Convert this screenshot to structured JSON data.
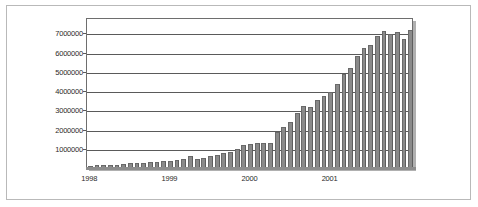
{
  "chart_data": {
    "type": "bar",
    "title": "",
    "subtitle": "",
    "xlabel": "",
    "ylabel": "",
    "legend": [],
    "grid": true,
    "ylim": [
      0,
      7800000
    ],
    "ytick_labels": [
      "1000000",
      "2000000",
      "3000000",
      "4000000",
      "5000000",
      "6000000",
      "7000000"
    ],
    "ytick_values": [
      1000000,
      2000000,
      3000000,
      4000000,
      5000000,
      6000000,
      7000000
    ],
    "xtick_labels": [
      "1998",
      "1999",
      "2000",
      "2001"
    ],
    "xtick_positions": [
      0,
      12,
      24,
      36
    ],
    "bar_color": "#8a8a8a",
    "categories": [
      "1998-01",
      "1998-02",
      "1998-03",
      "1998-04",
      "1998-05",
      "1998-06",
      "1998-07",
      "1998-08",
      "1998-09",
      "1998-10",
      "1998-11",
      "1998-12",
      "1999-01",
      "1999-02",
      "1999-03",
      "1999-04",
      "1999-05",
      "1999-06",
      "1999-07",
      "1999-08",
      "1999-09",
      "1999-10",
      "1999-11",
      "1999-12",
      "2000-01",
      "2000-02",
      "2000-03",
      "2000-04",
      "2000-05",
      "2000-06",
      "2000-07",
      "2000-08",
      "2000-09",
      "2000-10",
      "2000-11",
      "2000-12",
      "2001-01",
      "2001-02",
      "2001-03",
      "2001-04",
      "2001-05",
      "2001-06",
      "2001-07"
    ],
    "values": [
      70000,
      90000,
      100000,
      110000,
      130000,
      160000,
      190000,
      210000,
      230000,
      250000,
      270000,
      300000,
      330000,
      370000,
      420000,
      560000,
      400000,
      470000,
      570000,
      640000,
      720000,
      790000,
      960000,
      1150000,
      1180000,
      1260000,
      1270000,
      1250000,
      1800000,
      2080000,
      2330000,
      2790000,
      3180000,
      3100000,
      3480000,
      3670000,
      3880000,
      4310000,
      4830000,
      5130000,
      5790000,
      6210000,
      6340000
    ],
    "values_tail": [
      6820000,
      7050000,
      6930000,
      7020000,
      6680000,
      7150000
    ]
  }
}
